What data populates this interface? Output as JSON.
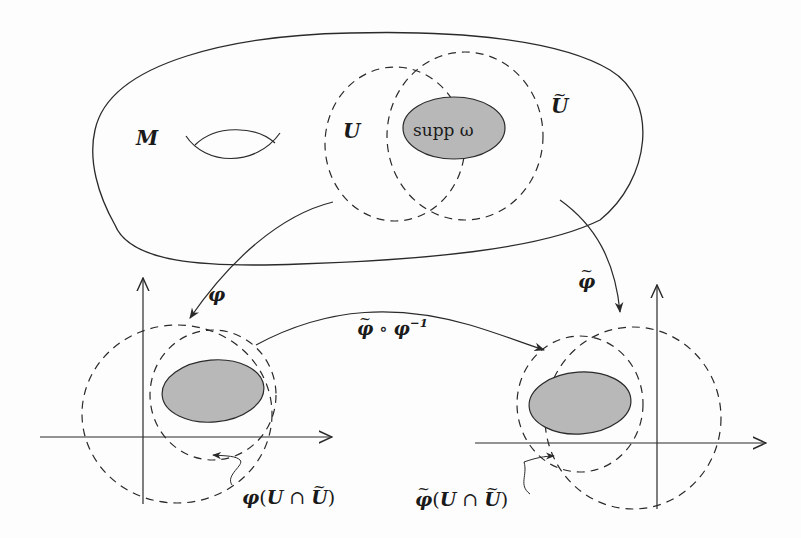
{
  "figure": {
    "manifold_label": "M",
    "chart_U_label": "U",
    "chart_Utilde_label": "U",
    "support_label": "supp ω",
    "map_phi_label": "φ",
    "map_phitilde_label": "φ",
    "transition_label_main": "φ ∘ φ",
    "transition_exponent": "−1",
    "left_image_label": "φ(U ∩ U)",
    "left_image_parts": {
      "fn": "φ",
      "open": "(",
      "U": "U",
      "cap": " ∩ ",
      "Ut": "U",
      "close": ")"
    },
    "right_image_parts": {
      "fn": "φ",
      "open": "(",
      "U": "U",
      "cap": " ∩ ",
      "Ut": "U",
      "close": ")"
    }
  },
  "colors": {
    "stroke": "#2a2a2a",
    "support_fill": "#b8b8b8",
    "background": "#fdfdfd"
  }
}
